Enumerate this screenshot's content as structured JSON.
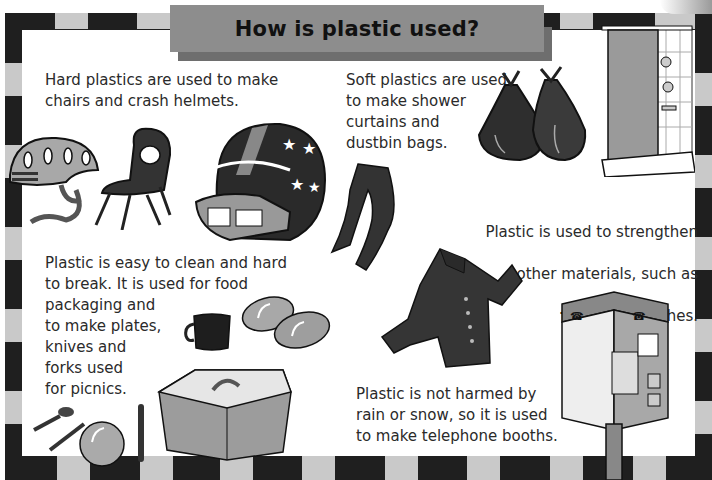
{
  "page": {
    "title": "How is plastic used?",
    "colors": {
      "border_dark": "#1f1f1f",
      "border_light": "#c9c9c9",
      "title_bar": "#8d8d8d",
      "title_shadow": "#6e6e6e",
      "text": "#2a2a2a"
    }
  },
  "captions": {
    "hard_plastics": "Hard plastics are used to make\nchairs and crash helmets.",
    "soft_plastics": "Soft plastics are used\nto make shower\ncurtains and\ndustbin bags.",
    "strengthen_line1": "Plastic is used to strengthen",
    "strengthen_line2": "other materials, such as",
    "strengthen_bold": "fabric",
    "strengthen_end": " for clothes.",
    "easy_clean": "Plastic is easy to clean and hard\nto break. It is used for food\npackaging and\nto make plates,\nknives and\nforks used\nfor picnics.",
    "weather": "Plastic is not harmed by\nrain or snow, so it is used\nto make telephone booths."
  },
  "illustrations": [
    {
      "name": "bike-helmet"
    },
    {
      "name": "plastic-chair"
    },
    {
      "name": "football-helmet"
    },
    {
      "name": "dustbin-bags"
    },
    {
      "name": "shower-curtain"
    },
    {
      "name": "tights"
    },
    {
      "name": "shirt"
    },
    {
      "name": "mug"
    },
    {
      "name": "plates"
    },
    {
      "name": "food-container"
    },
    {
      "name": "cutlery"
    },
    {
      "name": "telephone-booth"
    }
  ]
}
